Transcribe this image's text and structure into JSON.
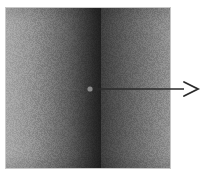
{
  "figure": {
    "kind": "grayscale-intensity-image",
    "canvas": {
      "width": 205,
      "height": 179,
      "background": "#ffffff"
    },
    "panel": {
      "x": 6,
      "y": 8,
      "width": 164,
      "height": 160,
      "border_color": "#c8c8c8"
    },
    "gradient": {
      "direction": "horizontal",
      "description": "bright edges with a broad dark vertical band near the centre-left",
      "stops": [
        {
          "pos": 0,
          "color": "#a2a2a2"
        },
        {
          "pos": 6,
          "color": "#9a9a9a"
        },
        {
          "pos": 14,
          "color": "#8d8d8d"
        },
        {
          "pos": 22,
          "color": "#7c7c7c"
        },
        {
          "pos": 30,
          "color": "#6a6a6a"
        },
        {
          "pos": 38,
          "color": "#575757"
        },
        {
          "pos": 46,
          "color": "#3f3f3f"
        },
        {
          "pos": 54,
          "color": "#272727"
        },
        {
          "pos": 62,
          "color": "#141414"
        },
        {
          "pos": 70,
          "color": "#0b0b0b"
        },
        {
          "pos": 78,
          "color": "#080808"
        },
        {
          "pos": 86,
          "color": "#0c0c0c"
        },
        {
          "pos": 92,
          "color": "#1a1a1a"
        },
        {
          "pos": 97,
          "color": "#2e2e2e"
        },
        {
          "pos": 100,
          "color": "#3a3a3a"
        }
      ],
      "right_shoulder": [
        {
          "pos": 0,
          "color": "#3a3a3a"
        },
        {
          "pos": 100,
          "color": "#8a8a8a"
        }
      ]
    },
    "annotation": {
      "marker": {
        "label": "point-of-interest",
        "cx": 90,
        "cy": 89,
        "r": 2.6,
        "color": "#8a8a8a"
      },
      "arrow": {
        "label": "pointer-arrow",
        "x1": 92,
        "y1": 89,
        "x2": 184,
        "y2": 89,
        "color": "#2b2b2b",
        "stroke_width": 1.6,
        "head": {
          "style": "open-chevron",
          "tip_x": 198,
          "tip_y": 89,
          "half_height": 7,
          "length": 14
        }
      }
    }
  }
}
